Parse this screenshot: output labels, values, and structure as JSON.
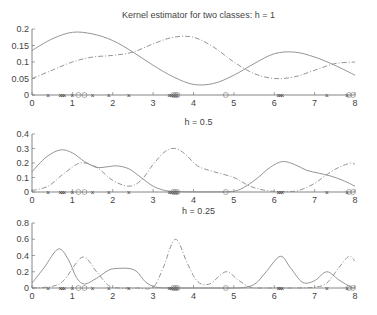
{
  "chart_data": [
    {
      "type": "line",
      "title": "Kernel estimator for two classes: h = 1",
      "xlim": [
        0,
        8
      ],
      "ylim": [
        0,
        0.2
      ],
      "xticks": [
        0,
        1,
        2,
        3,
        4,
        5,
        6,
        7,
        8
      ],
      "yticks": [
        0,
        0.05,
        0.1,
        0.15,
        0.2
      ],
      "ytick_labels": [
        "0",
        "0.05",
        "0.1",
        "0.15",
        "0.2"
      ],
      "series": [
        {
          "name": "class 1 (solid)",
          "style": "solid",
          "x": [
            0,
            0.5,
            1,
            1.5,
            2,
            2.5,
            3,
            3.5,
            4,
            4.5,
            5,
            5.5,
            6,
            6.5,
            7,
            7.5,
            8
          ],
          "y": [
            0.135,
            0.17,
            0.19,
            0.185,
            0.165,
            0.13,
            0.09,
            0.055,
            0.032,
            0.035,
            0.06,
            0.095,
            0.125,
            0.13,
            0.115,
            0.09,
            0.06
          ]
        },
        {
          "name": "class 2 (dash-dot)",
          "style": "dashdot",
          "x": [
            0,
            0.5,
            1,
            1.5,
            2,
            2.5,
            3,
            3.5,
            4,
            4.5,
            5,
            5.5,
            6,
            6.5,
            7,
            7.5,
            8
          ],
          "y": [
            0.05,
            0.075,
            0.1,
            0.115,
            0.12,
            0.13,
            0.155,
            0.175,
            0.175,
            0.145,
            0.1,
            0.065,
            0.05,
            0.055,
            0.075,
            0.095,
            0.1
          ]
        }
      ]
    },
    {
      "type": "line",
      "title": "h = 0.5",
      "xlim": [
        0,
        8
      ],
      "ylim": [
        0,
        0.4
      ],
      "xticks": [
        0,
        1,
        2,
        3,
        4,
        5,
        6,
        7,
        8
      ],
      "yticks": [
        0,
        0.1,
        0.2,
        0.3,
        0.4
      ],
      "ytick_labels": [
        "0",
        "0.1",
        "0.2",
        "0.3",
        "0.4"
      ],
      "series": [
        {
          "name": "class 1 (solid)",
          "style": "solid",
          "x": [
            0,
            0.35,
            0.7,
            1,
            1.3,
            1.6,
            1.9,
            2.1,
            2.4,
            2.7,
            3,
            3.3,
            3.6,
            4,
            4.5,
            5,
            5.3,
            5.6,
            5.9,
            6.2,
            6.5,
            6.8,
            7.1,
            7.4,
            7.7,
            8
          ],
          "y": [
            0.14,
            0.24,
            0.29,
            0.27,
            0.21,
            0.17,
            0.175,
            0.18,
            0.16,
            0.1,
            0.04,
            0.01,
            0.003,
            0.001,
            0.001,
            0.005,
            0.04,
            0.1,
            0.17,
            0.21,
            0.19,
            0.15,
            0.13,
            0.11,
            0.08,
            0.04
          ]
        },
        {
          "name": "class 2 (dash-dot)",
          "style": "dashdot",
          "x": [
            0,
            0.4,
            0.8,
            1.2,
            1.6,
            2,
            2.4,
            2.7,
            3,
            3.3,
            3.55,
            3.8,
            4.1,
            4.5,
            5,
            5.4,
            5.8,
            6.2,
            6.6,
            7,
            7.3,
            7.6,
            7.9,
            8
          ],
          "y": [
            0.01,
            0.04,
            0.13,
            0.2,
            0.17,
            0.08,
            0.04,
            0.08,
            0.19,
            0.28,
            0.3,
            0.26,
            0.18,
            0.14,
            0.1,
            0.04,
            0.01,
            0.003,
            0.01,
            0.06,
            0.12,
            0.17,
            0.2,
            0.19
          ]
        }
      ]
    },
    {
      "type": "line",
      "title": "h = 0.25",
      "xlim": [
        0,
        8
      ],
      "ylim": [
        0,
        0.8
      ],
      "xticks": [
        0,
        1,
        2,
        3,
        4,
        5,
        6,
        7,
        8
      ],
      "yticks": [
        0,
        0.2,
        0.4,
        0.6,
        0.8
      ],
      "ytick_labels": [
        "0",
        "0.2",
        "0.4",
        "0.6",
        "0.8"
      ],
      "series": [
        {
          "name": "class 1 (solid)",
          "style": "solid",
          "x": [
            0,
            0.3,
            0.65,
            0.9,
            1.1,
            1.3,
            1.6,
            1.9,
            2.1,
            2.4,
            2.6,
            2.8,
            3,
            3.2,
            3.5,
            4,
            4.5,
            5,
            5.3,
            5.55,
            5.8,
            6.15,
            6.4,
            6.7,
            7,
            7.3,
            7.6,
            7.9,
            8
          ],
          "y": [
            0.06,
            0.25,
            0.48,
            0.35,
            0.13,
            0.05,
            0.12,
            0.22,
            0.24,
            0.24,
            0.2,
            0.08,
            0.02,
            0.003,
            0.0,
            0.0,
            0.0,
            0.0,
            0.01,
            0.06,
            0.2,
            0.39,
            0.25,
            0.07,
            0.09,
            0.2,
            0.1,
            0.01,
            0.0
          ]
        },
        {
          "name": "class 2 (dash-dot)",
          "style": "dashdot",
          "x": [
            0,
            0.5,
            0.8,
            1.25,
            1.6,
            1.9,
            2.2,
            2.6,
            3,
            3.25,
            3.55,
            3.85,
            4.1,
            4.4,
            4.8,
            5.1,
            5.4,
            5.7,
            6,
            6.5,
            7,
            7.3,
            7.6,
            7.85,
            8
          ],
          "y": [
            0.0,
            0.02,
            0.1,
            0.38,
            0.2,
            0.03,
            0.0,
            0.0,
            0.01,
            0.25,
            0.6,
            0.3,
            0.08,
            0.05,
            0.2,
            0.1,
            0.01,
            0.0,
            0.0,
            0.0,
            0.01,
            0.06,
            0.25,
            0.39,
            0.33
          ]
        }
      ]
    }
  ],
  "data_points": {
    "class1_markers_x": [
      0.4,
      0.7,
      0.75,
      0.8,
      1.0,
      1.5,
      1.9,
      2.4,
      3.4,
      3.45,
      3.5,
      3.55,
      3.6,
      6.1,
      6.15,
      6.2,
      7.3,
      7.8
    ],
    "class2_markers_x": [
      1.15,
      1.3,
      3.5,
      3.55,
      3.6,
      4.8,
      7.85,
      7.95
    ]
  }
}
